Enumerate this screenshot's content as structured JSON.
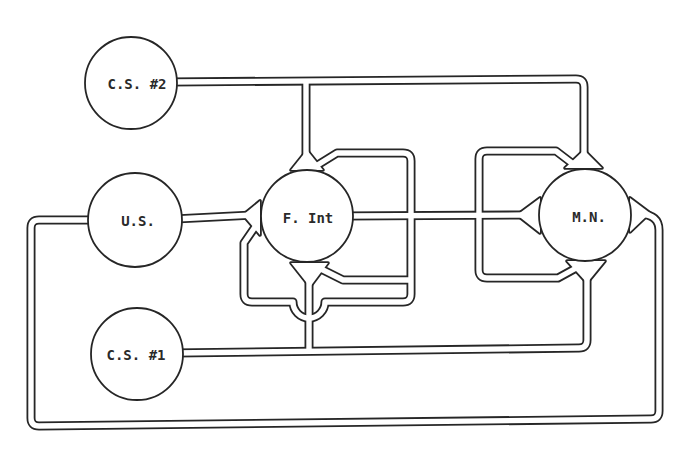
{
  "figure": {
    "nodes": {
      "cs2": {
        "label": "C.S. #2"
      },
      "us": {
        "label": "U.S."
      },
      "fint": {
        "label": "F. Int"
      },
      "mn": {
        "label": "M.N."
      },
      "cs1": {
        "label": "C.S. #1"
      }
    },
    "connections": [
      {
        "from": "C.S. #2",
        "to": "F. Int",
        "synapse": "top"
      },
      {
        "from": "C.S. #2",
        "to": "M.N.",
        "synapse": "top"
      },
      {
        "from": "U.S.",
        "to": "F. Int",
        "synapse": "left"
      },
      {
        "from": "U.S.",
        "to": "M.N.",
        "synapse": "right"
      },
      {
        "from": "C.S. #1",
        "to": "F. Int",
        "synapse": "bottom"
      },
      {
        "from": "C.S. #1",
        "to": "M.N.",
        "synapse": "bottom"
      },
      {
        "from": "F. Int",
        "to": "M.N.",
        "synapse": "left"
      },
      {
        "from": "F. Int",
        "to": "F. Int",
        "synapse": "top (side input)"
      },
      {
        "from": "F. Int",
        "to": "F. Int",
        "synapse": "bottom (side input)"
      },
      {
        "from": "F. Int",
        "to": "F. Int",
        "synapse": "left (side input)"
      },
      {
        "from": "F. Int",
        "to": "M.N.",
        "synapse": "top (side input)"
      },
      {
        "from": "F. Int",
        "to": "M.N.",
        "synapse": "bottom (side input)"
      }
    ]
  },
  "colors": {
    "line": "#262626",
    "background": "#ffffff",
    "node_fill": "#ffffff",
    "label": "#2a2a2a"
  }
}
